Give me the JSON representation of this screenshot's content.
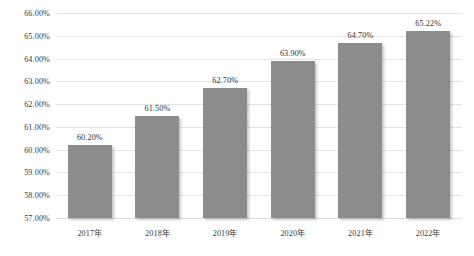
{
  "chart_data": {
    "type": "bar",
    "title": "",
    "subtitle": "",
    "xlabel": "",
    "ylabel": "",
    "categories": [
      "2017年",
      "2018年",
      "2019年",
      "2020年",
      "2021年",
      "2022年"
    ],
    "values": [
      60.2,
      61.5,
      62.7,
      63.9,
      64.7,
      65.22
    ],
    "value_labels": [
      "60.20%",
      "61.50%",
      "62.70%",
      "63.90%",
      "64.70%",
      "65.22%"
    ],
    "ylim": [
      57.0,
      66.0
    ],
    "ytick_values": [
      66.0,
      65.0,
      64.0,
      63.0,
      62.0,
      61.0,
      60.0,
      59.0,
      58.0,
      57.0
    ],
    "ytick_labels": [
      "66.00%",
      "65.00%",
      "64.00%",
      "63.00%",
      "62.00%",
      "61.00%",
      "60.00%",
      "59.00%",
      "58.00%",
      "57.00%"
    ],
    "grid": "horizontal",
    "legend": "none",
    "series": [
      {
        "name": "",
        "values": [
          60.2,
          61.5,
          62.7,
          63.9,
          64.7,
          65.22
        ]
      }
    ],
    "colors": {
      "bar": "#8c8c8c",
      "gridline": "#e3e3e3",
      "background": "#ffffff",
      "text": "#3a3a3a"
    }
  }
}
